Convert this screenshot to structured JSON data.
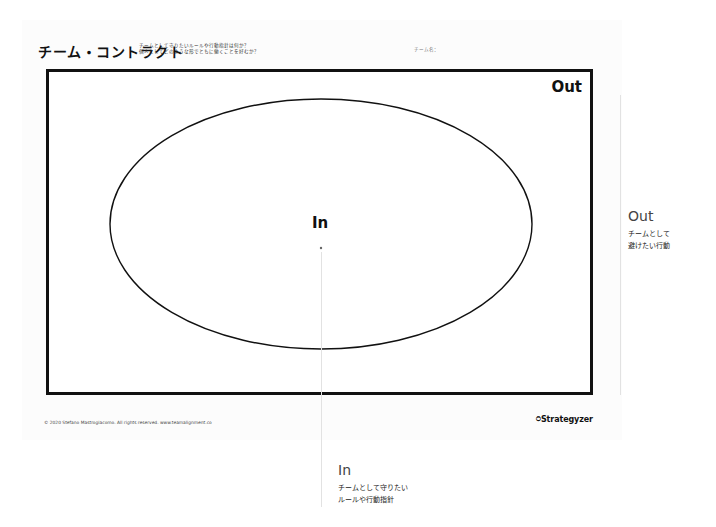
{
  "header": {
    "title": "チーム・コントラクト",
    "subtitle_lines": [
      "チームとして守りたいルールや行動指針は何か？",
      "個人としてどのような形でともに働くことを好むか？"
    ],
    "team_name_label": "チーム名："
  },
  "canvas": {
    "out_label": "Out",
    "in_label": "In"
  },
  "footer": {
    "copyright": "© 2020 Stefano Mastrogiacomo. All rights reserved. www.teamalignment.co",
    "brand": "Strategyzer",
    "brand_icon": "strategyzer-logo-icon"
  },
  "callouts": {
    "out": {
      "heading": "Out",
      "lines": [
        "チームとして",
        "避けたい行動"
      ]
    },
    "in": {
      "heading": "In",
      "lines": [
        "チームとして守りたい",
        "ルールや行動指針"
      ]
    }
  },
  "colors": {
    "frame": "#111111",
    "callout_heading": "#444444",
    "guide_line": "#e2e2e2"
  }
}
